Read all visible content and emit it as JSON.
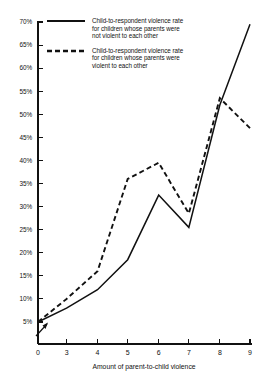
{
  "chart_data": {
    "type": "line",
    "title": "",
    "xlabel": "Amount of parent-to-child violence",
    "ylabel": "",
    "x": [
      0,
      3,
      4,
      5,
      6,
      7,
      8,
      9
    ],
    "x_tick_labels": [
      "0",
      "3",
      "4",
      "5",
      "6",
      "7",
      "8",
      "9"
    ],
    "y_tick_labels": [
      "5%",
      "10%",
      "15%",
      "20%",
      "25%",
      "30%",
      "35%",
      "40%",
      "45%",
      "50%",
      "55%",
      "60%",
      "65%",
      "70%"
    ],
    "y_tick_values": [
      5,
      10,
      15,
      20,
      25,
      30,
      35,
      40,
      45,
      50,
      55,
      60,
      65,
      70
    ],
    "ylim": [
      0,
      70
    ],
    "xlim": [
      0,
      9
    ],
    "grid": false,
    "legend_position": "top-left",
    "series": [
      {
        "name": "Child-to-respondent violence rate\nfor children whose parents were\nnot violent to each other",
        "style": "solid",
        "color": "#111111",
        "values": [
          5.0,
          8.0,
          12.0,
          18.5,
          32.5,
          25.5,
          52.0,
          69.5
        ]
      },
      {
        "name": "Child-to-respondent violence rate\nfor children whose parents were\nviolent to each other",
        "style": "dashed",
        "color": "#111111",
        "values": [
          5.0,
          10.0,
          16.0,
          36.0,
          39.5,
          28.5,
          53.5,
          47.0
        ]
      }
    ]
  },
  "legend": {
    "entries": [
      {
        "label": "Child-to-respondent violence rate\nfor children whose parents were\nnot violent to each other",
        "style": "solid"
      },
      {
        "label": "Child-to-respondent violence rate\nfor children whose parents were\nviolent to each other",
        "style": "dashed"
      }
    ]
  },
  "axes": {
    "x_title": "Amount of parent-to-child violence"
  }
}
